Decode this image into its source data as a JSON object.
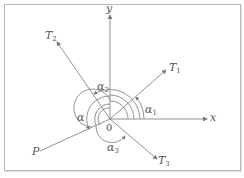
{
  "diagram": {
    "axes": {
      "x_label": "x",
      "y_label": "y",
      "origin_label": "0"
    },
    "rays": [
      {
        "name": "T",
        "sub": "1"
      },
      {
        "name": "T",
        "sub": "2"
      },
      {
        "name": "T",
        "sub": "3"
      },
      {
        "name": "P",
        "sub": ""
      }
    ],
    "angles": [
      {
        "name": "α",
        "sub": "1"
      },
      {
        "name": "α",
        "sub": "2"
      },
      {
        "name": "α",
        "sub": "3"
      },
      {
        "name": "α",
        "sub": ""
      }
    ],
    "colors": {
      "line": "#777777",
      "text": "#555555",
      "border": "#b8b8b8"
    }
  }
}
